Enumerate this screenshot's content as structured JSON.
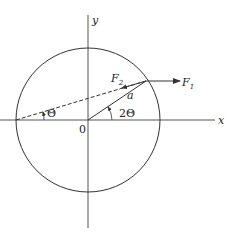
{
  "diagram": {
    "axes": {
      "x_label": "x",
      "y_label": "y",
      "origin_label": "0"
    },
    "vectors": {
      "f1": {
        "label": "F",
        "subscript": "1"
      },
      "f2": {
        "label": "F",
        "subscript": "2"
      }
    },
    "radius_label": "a",
    "angles": {
      "small": "Θ",
      "large": "2Θ"
    },
    "colors": {
      "stroke": "#333333",
      "background": "#ffffff"
    }
  }
}
